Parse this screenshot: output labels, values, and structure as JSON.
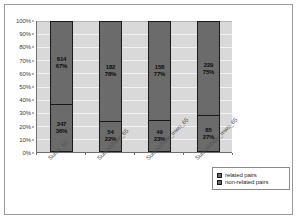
{
  "chart_data": {
    "type": "bar",
    "subtype": "100-percent-stacked-column",
    "title": "",
    "xlabel": "",
    "ylabel": "",
    "ylim": [
      0,
      100
    ],
    "grid": true,
    "legend_position": "bottom-right",
    "categories": [
      "Sumo_65",
      "SumoWhale_65",
      "SumoWhale_mwu_65",
      "SumoWhale_mwu_65"
    ],
    "y_tick_labels": [
      "0%",
      "10%",
      "20%",
      "30%",
      "40%",
      "50%",
      "60%",
      "70%",
      "80%",
      "90%",
      "100%"
    ],
    "y_tick_values": [
      0,
      10,
      20,
      30,
      40,
      50,
      60,
      70,
      80,
      90,
      100
    ],
    "series": [
      {
        "name": "related pairs",
        "counts": [
          347,
          54,
          49,
          85
        ],
        "percent_labels": [
          "36%",
          "22%",
          "23%",
          "27%"
        ],
        "values": [
          36,
          22,
          23,
          27
        ],
        "color": "#6b6b6b"
      },
      {
        "name": "non-related pairs",
        "counts": [
          614,
          182,
          158,
          229
        ],
        "percent_labels": [
          "67%",
          "78%",
          "77%",
          "75%"
        ],
        "values": [
          64,
          78,
          77,
          73
        ],
        "color": "#6b6b6b"
      }
    ]
  },
  "legend": {
    "items": [
      {
        "label": "related pairs"
      },
      {
        "label": "non-related pairs"
      }
    ]
  },
  "bar_labels": [
    {
      "top_count": "614",
      "top_pct": "67%",
      "bottom_count": "347",
      "bottom_pct": "36%"
    },
    {
      "top_count": "182",
      "top_pct": "78%",
      "bottom_count": "54",
      "bottom_pct": "22%"
    },
    {
      "top_count": "158",
      "top_pct": "77%",
      "bottom_count": "49",
      "bottom_pct": "23%"
    },
    {
      "top_count": "229",
      "top_pct": "75%",
      "bottom_count": "85",
      "bottom_pct": "27%"
    }
  ],
  "colors": {
    "bar_fill": "#6b6b6b",
    "bar_border": "#1a1a1a",
    "plot_background": "#d9d9d9",
    "gridline": "#f2f2f2",
    "axis": "#6e6e6e",
    "frame": "#9a9a9a"
  }
}
